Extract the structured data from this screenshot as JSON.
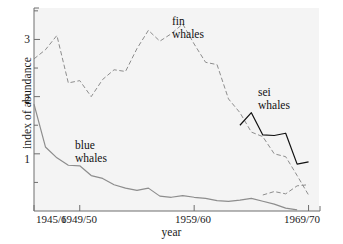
{
  "chart_data": {
    "type": "line",
    "title": "",
    "xlabel": "year",
    "ylabel": "index of abundance",
    "xlim": [
      1945,
      1970
    ],
    "ylim": [
      0,
      3.55
    ],
    "grid": false,
    "legend_position": "inline-annotations",
    "x_tick_labels": [
      "1945/6",
      "1949/50",
      "1959/60",
      "1969/70"
    ],
    "x_tick_values": [
      1945,
      1949,
      1959,
      1969
    ],
    "y_tick_labels": [
      "1",
      "2",
      "3"
    ],
    "y_tick_values": [
      1,
      2,
      3
    ],
    "y_minor_ticks": [
      0.5,
      1.5,
      2.5,
      3.5
    ],
    "series": [
      {
        "name": "fin whales",
        "style": "dashed",
        "color": "#8d8d8d",
        "x": [
          1945,
          1946,
          1947,
          1948,
          1949,
          1950,
          1951,
          1952,
          1953,
          1954,
          1955,
          1956,
          1957,
          1958,
          1959,
          1960,
          1961,
          1962,
          1963,
          1964,
          1965,
          1966,
          1967,
          1968,
          1969
        ],
        "values": [
          2.66,
          2.82,
          3.07,
          2.24,
          2.28,
          2.0,
          2.3,
          2.47,
          2.44,
          2.84,
          3.16,
          2.97,
          3.1,
          3.27,
          2.92,
          2.6,
          2.56,
          1.96,
          1.72,
          1.38,
          1.3,
          1.0,
          0.95,
          0.62,
          0.28
        ]
      },
      {
        "name": "blue whales",
        "style": "solid",
        "color": "#8d8d8d",
        "x": [
          1945,
          1946,
          1947,
          1948,
          1949,
          1950,
          1951,
          1952,
          1953,
          1954,
          1955,
          1956,
          1957,
          1958,
          1959,
          1960,
          1961,
          1962,
          1963,
          1964,
          1965,
          1966,
          1967,
          1968
        ],
        "values": [
          1.87,
          1.12,
          0.93,
          0.8,
          0.79,
          0.62,
          0.57,
          0.46,
          0.4,
          0.36,
          0.4,
          0.26,
          0.24,
          0.27,
          0.24,
          0.22,
          0.18,
          0.17,
          0.19,
          0.22,
          0.17,
          0.12,
          0.05,
          0.02
        ]
      },
      {
        "name": "sei whales",
        "style": "solid",
        "color": "#111111",
        "x": [
          1963,
          1964,
          1965,
          1966,
          1967,
          1968,
          1969
        ],
        "values": [
          1.5,
          1.72,
          1.33,
          1.32,
          1.36,
          0.82,
          0.86
        ]
      },
      {
        "name": "fin whales tail",
        "style": "dashed",
        "color": "#8d8d8d",
        "x": [
          1965,
          1966,
          1967,
          1968,
          1969
        ],
        "values": [
          0.28,
          0.34,
          0.3,
          0.44,
          0.46
        ]
      }
    ],
    "annotations": [
      {
        "text": "fin whales",
        "lines": [
          "fin",
          "whales"
        ]
      },
      {
        "text": "blue whales",
        "lines": [
          "blue",
          "whales"
        ]
      },
      {
        "text": "sei whales",
        "lines": [
          "sei",
          "whales"
        ]
      }
    ]
  },
  "axes": {
    "ylabel": "index of abundance",
    "xlabel": "year",
    "xticks": [
      {
        "label": "1945/6",
        "left": 36
      },
      {
        "label": "1949/50",
        "left": 61
      },
      {
        "label": "1959/60",
        "left": 175
      },
      {
        "label": "1969/70",
        "left": 284
      }
    ],
    "yticks": [
      {
        "label": "3",
        "top": 33
      },
      {
        "label": "2",
        "top": 93
      },
      {
        "label": "1",
        "top": 153
      }
    ]
  },
  "labels": {
    "fin_line1": "fin",
    "fin_line2": "whales",
    "blue_line1": "blue",
    "blue_line2": "whales",
    "sei_line1": "sei",
    "sei_line2": "whales"
  },
  "colors": {
    "plot_background": "#f4f4f4",
    "page_background": "#ffffff",
    "axis": "#6e6e6e",
    "fin_line": "#8d8d8d",
    "blue_line": "#8d8d8d",
    "sei_line": "#111111",
    "text": "#1a1a1a"
  }
}
